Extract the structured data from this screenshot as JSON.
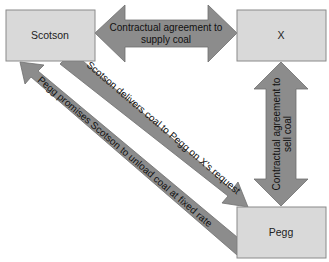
{
  "nodes": {
    "scotson": "Scotson",
    "x": "X",
    "pegg": "Pegg"
  },
  "edges": {
    "scotson_x": {
      "line1": "Contractual agreement to",
      "line2": "supply coal",
      "direction": "bidirectional"
    },
    "x_pegg": {
      "line1": "Contractual agreement to",
      "line2": "sell coal",
      "direction": "bidirectional"
    },
    "scotson_to_pegg": {
      "label": "Scotson delivers coal to Pegg on X's request",
      "direction": "Scotson→Pegg"
    },
    "pegg_to_scotson": {
      "label": "Pegg promises Scotson to unload coal at fixed rate",
      "direction": "Pegg→Scotson"
    }
  },
  "colors": {
    "box_fill": "#d9d9d9",
    "arrow_fill": "#8c8c8c"
  }
}
